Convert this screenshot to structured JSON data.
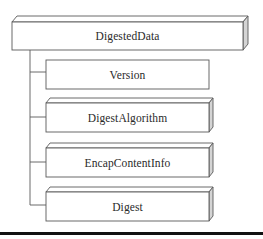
{
  "diagram": {
    "type": "hierarchy",
    "root": {
      "label": "DigestedData"
    },
    "children": [
      {
        "label": "Version",
        "style": "flat"
      },
      {
        "label": "DigestAlgorithm",
        "style": "3d"
      },
      {
        "label": "EncapContentInfo",
        "style": "3d"
      },
      {
        "label": "Digest",
        "style": "3d"
      }
    ]
  },
  "colors": {
    "line": "#5a5a5a",
    "side_face": "#d4d4d4",
    "top_face": "#ffffff",
    "rule": "#111111",
    "text": "#2a2a2a"
  }
}
